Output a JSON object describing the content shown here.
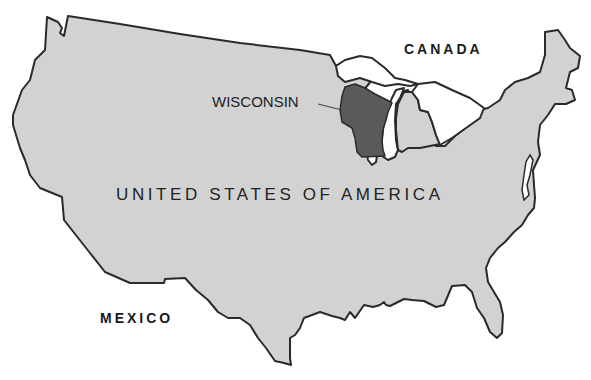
{
  "map": {
    "title_label": "UNITED STATES OF AMERICA",
    "highlighted_state": "WISCONSIN",
    "neighbor_labels": {
      "north": "CANADA",
      "south": "MEXICO"
    },
    "colors": {
      "land_fill": "#d2d2d2",
      "highlight_fill": "#5a5a5a",
      "outline": "#2a2a2a",
      "water": "#ffffff",
      "text": "#1a1a1a"
    }
  }
}
